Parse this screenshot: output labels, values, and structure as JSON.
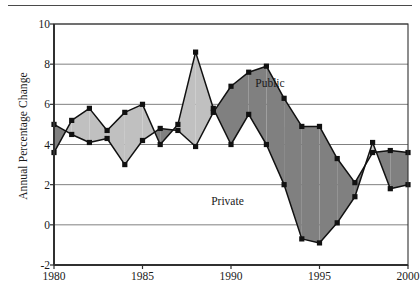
{
  "chart_data": {
    "type": "line",
    "title": "",
    "subtitle": "",
    "xlabel": "",
    "ylabel": "Annual Percentage Change",
    "xlim": [
      1980,
      2000
    ],
    "ylim": [
      -2,
      10
    ],
    "ytick_labels": [
      "10",
      "8",
      "6",
      "4",
      "2",
      "0",
      "-2"
    ],
    "ytick_values": [
      10,
      8,
      6,
      4,
      2,
      0,
      -2
    ],
    "xtick_labels": [
      "1980",
      "1985",
      "1990",
      "1995",
      "2000"
    ],
    "xtick_values": [
      1980,
      1985,
      1990,
      1995,
      2000
    ],
    "grid": true,
    "grid_axis": "y",
    "legend_position": "inline-annotation",
    "x": [
      1980,
      1981,
      1982,
      1983,
      1984,
      1985,
      1986,
      1987,
      1988,
      1989,
      1990,
      1991,
      1992,
      1993,
      1994,
      1995,
      1996,
      1997,
      1998,
      1999,
      2000
    ],
    "series": [
      {
        "name": "Public",
        "fill_color": "#808080",
        "line_color": "#111111",
        "marker": "square",
        "values": [
          5.0,
          4.5,
          4.1,
          4.3,
          3.0,
          4.2,
          4.8,
          4.7,
          3.9,
          5.6,
          6.9,
          7.6,
          7.9,
          6.3,
          4.9,
          4.9,
          3.3,
          2.1,
          3.6,
          3.7,
          3.6
        ]
      },
      {
        "name": "Private",
        "fill_color": "#c0c0c0",
        "line_color": "#111111",
        "marker": "square",
        "values": [
          3.6,
          5.2,
          5.8,
          4.7,
          5.6,
          6.0,
          4.0,
          5.0,
          8.6,
          5.8,
          4.0,
          5.5,
          4.0,
          2.0,
          -0.7,
          -0.9,
          0.1,
          1.4,
          4.1,
          1.8,
          2.0
        ]
      }
    ],
    "annotations": [
      {
        "text": "Public",
        "x": 1992.2,
        "y": 7.05
      },
      {
        "text": "Private",
        "x": 1989.8,
        "y": 1.2
      }
    ]
  },
  "figure": {
    "top_rule_visible": true,
    "axis_color": "#303030",
    "grid_color": "#808080",
    "background": "#ffffff"
  }
}
